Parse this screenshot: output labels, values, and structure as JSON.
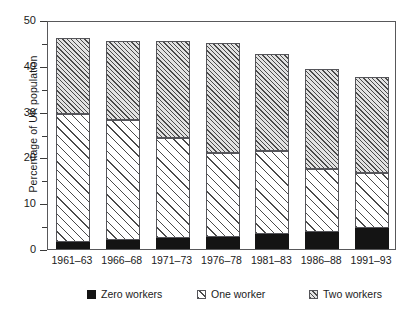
{
  "chart_data": {
    "type": "bar",
    "subtype": "stacked-vertical",
    "title": "",
    "xlabel": "",
    "ylabel": "Percentage of UK population",
    "ylim": [
      0,
      50
    ],
    "ytick_step": 10,
    "yticks": [
      0,
      10,
      20,
      30,
      40,
      50
    ],
    "ytick_labels": [
      "0",
      "10",
      "20",
      "30",
      "40",
      "50"
    ],
    "minor_ticks": true,
    "grid": false,
    "legend_position": "below",
    "categories": [
      "1961–63",
      "1966–68",
      "1971–73",
      "1976–78",
      "1981–83",
      "1986–88",
      "1991–93"
    ],
    "series": [
      {
        "name": "Zero workers",
        "pattern": "solid-black",
        "color": "#141414",
        "values": [
          1.6,
          2.0,
          2.3,
          2.7,
          3.3,
          3.8,
          4.6
        ]
      },
      {
        "name": "One worker",
        "pattern": "sparse-hatch",
        "color": "#ffffff",
        "values": [
          27.9,
          26.2,
          21.9,
          18.3,
          18.0,
          13.7,
          12.1
        ]
      },
      {
        "name": "Two workers",
        "pattern": "dense-hatch",
        "color": "#e2e2e2",
        "values": [
          16.5,
          17.3,
          21.3,
          24.0,
          21.2,
          21.8,
          20.8
        ]
      }
    ],
    "cumulative_tops": {
      "zero": [
        1.6,
        2.0,
        2.3,
        2.7,
        3.3,
        3.8,
        4.6
      ],
      "zero_plus_one": [
        29.5,
        28.2,
        24.2,
        21.0,
        21.3,
        17.5,
        16.7
      ],
      "total": [
        46.0,
        45.5,
        45.5,
        45.0,
        42.5,
        39.3,
        37.5
      ]
    }
  },
  "legend": {
    "items": [
      {
        "label": "Zero workers"
      },
      {
        "label": "One worker"
      },
      {
        "label": "Two workers"
      }
    ]
  }
}
